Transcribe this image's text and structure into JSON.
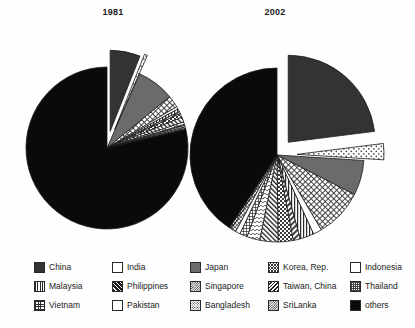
{
  "figure": {
    "background": "#fefefe",
    "panels": [
      {
        "id": "panel-1981",
        "title": "1981"
      },
      {
        "id": "panel-2002",
        "title": "2002"
      }
    ]
  },
  "legend": {
    "position": "bottom",
    "rows": [
      [
        {
          "label": "China",
          "pattern": "solid-darkgray"
        },
        {
          "label": "India",
          "pattern": "dots-light"
        },
        {
          "label": "Japan",
          "pattern": "solid-midgray"
        },
        {
          "label": "Korea, Rep.",
          "pattern": "crosshatch"
        },
        {
          "label": "Indonesia",
          "pattern": "open"
        }
      ],
      [
        {
          "label": "Malaysia",
          "pattern": "vbars"
        },
        {
          "label": "Philippines",
          "pattern": "diag-fwd"
        },
        {
          "label": "Singapore",
          "pattern": "checker"
        },
        {
          "label": "Taiwan, China",
          "pattern": "diag-back"
        },
        {
          "label": "Thailand",
          "pattern": "wave"
        }
      ],
      [
        {
          "label": "Vietnam",
          "pattern": "grid-dense"
        },
        {
          "label": "Pakistan",
          "pattern": "open"
        },
        {
          "label": "Bangladesh",
          "pattern": "speckle"
        },
        {
          "label": "SriLanka",
          "pattern": "checker"
        },
        {
          "label": "others",
          "pattern": "solid-black"
        }
      ]
    ]
  },
  "colors": {
    "china": "#333333",
    "japan": "#6b6b6b",
    "others": "#0a0a0a",
    "outline": "#1b1b1b",
    "page_background": "#fefefe"
  },
  "chart_data": [
    {
      "type": "pie",
      "title": "1981",
      "center": [
        107,
        148
      ],
      "radius": 81,
      "start_angle_deg": -90,
      "labels": [
        "China",
        "India",
        "Japan",
        "Korea, Rep.",
        "Indonesia",
        "Malaysia",
        "Philippines",
        "Singapore",
        "Taiwan, China",
        "Thailand",
        "Vietnam",
        "Pakistan",
        "Bangladesh",
        "SriLanka",
        "others"
      ],
      "values": [
        6.0,
        0.6,
        7.5,
        2.4,
        0.5,
        0.6,
        0.4,
        0.8,
        1.0,
        0.5,
        0.2,
        0.3,
        0.3,
        0.2,
        78.7
      ],
      "units": "percent",
      "exploded": [
        "China",
        "India"
      ],
      "patterns": [
        "solid-darkgray",
        "dots-light",
        "solid-midgray",
        "crosshatch",
        "open",
        "vbars",
        "diag-fwd",
        "checker",
        "diag-back",
        "wave",
        "grid-dense",
        "open",
        "speckle",
        "checker",
        "solid-black"
      ]
    },
    {
      "type": "pie",
      "title": "2002",
      "center": [
        277,
        155
      ],
      "radius": 87,
      "start_angle_deg": -90,
      "labels": [
        "China",
        "India",
        "Japan",
        "Korea, Rep.",
        "Indonesia",
        "Malaysia",
        "Philippines",
        "Singapore",
        "Taiwan, China",
        "Thailand",
        "Vietnam",
        "Pakistan",
        "Bangladesh",
        "SriLanka",
        "others"
      ],
      "values": [
        23.0,
        3.0,
        6.5,
        9.0,
        1.6,
        2.6,
        1.3,
        2.8,
        3.4,
        2.4,
        1.4,
        0.9,
        0.9,
        0.4,
        40.8
      ],
      "units": "percent",
      "exploded": [
        "China",
        "India"
      ],
      "patterns": [
        "solid-darkgray",
        "dots-light",
        "solid-midgray",
        "crosshatch",
        "open",
        "vbars",
        "diag-fwd",
        "checker",
        "diag-back",
        "wave",
        "grid-dense",
        "open",
        "speckle",
        "checker",
        "solid-black"
      ]
    }
  ]
}
